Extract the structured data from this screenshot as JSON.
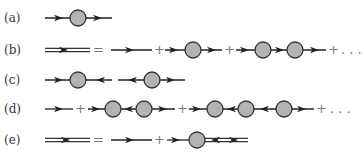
{
  "diagram": {
    "rows": [
      {
        "label": "(a)",
        "description": "single propagator with one blob"
      },
      {
        "label": "(b)",
        "description": "dressed propagator = bare + one blob + two blobs + ..."
      },
      {
        "label": "(c)",
        "description": "propagators with opposing arrows into/out of a blob"
      },
      {
        "label": "(d)",
        "description": "series with alternating arrow directions"
      },
      {
        "label": "(e)",
        "description": "dressed propagator = bare + blob followed by double line with bidirectional arrows"
      }
    ],
    "operators": {
      "equals": "=",
      "plus": "+",
      "ellipsis": ". . ."
    },
    "colors": {
      "line": "#222222",
      "blob_fill": "#b3b3b3",
      "blob_stroke": "#333333",
      "operator": "#777777"
    }
  }
}
